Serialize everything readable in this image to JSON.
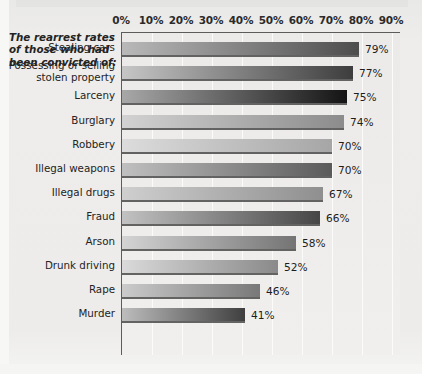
{
  "chart_data": {
    "type": "bar",
    "orientation": "horizontal",
    "title": "",
    "intro_label": "The rearrest rates of those who had been convicted of:",
    "xlabel": "",
    "ylabel": "",
    "xlim": [
      0,
      93
    ],
    "grid": true,
    "legend": "none",
    "tick_labels": [
      "0%",
      "10%",
      "20%",
      "30%",
      "40%",
      "50%",
      "60%",
      "70%",
      "80%",
      "90%"
    ],
    "tick_values": [
      0,
      10,
      20,
      30,
      40,
      50,
      60,
      70,
      80,
      90
    ],
    "categories": [
      "Stealing cars",
      "Possessing or selling\nstolen property",
      "Larceny",
      "Burglary",
      "Robbery",
      "Illegal weapons",
      "Illegal drugs",
      "Fraud",
      "Arson",
      "Drunk driving",
      "Rape",
      "Murder"
    ],
    "values": [
      79,
      77,
      75,
      74,
      70,
      70,
      67,
      66,
      58,
      52,
      46,
      41
    ],
    "value_labels": [
      "79%",
      "77%",
      "75%",
      "74%",
      "70%",
      "70%",
      "67%",
      "66%",
      "58%",
      "52%",
      "46%",
      "41%"
    ],
    "bar_styles": [
      {
        "from": "#b9b9b9",
        "to": "#4d4d4d"
      },
      {
        "from": "#c6c6c6",
        "to": "#3d3d3d"
      },
      {
        "from": "#a8a8a8",
        "to": "#141414"
      },
      {
        "from": "#d2d2d2",
        "to": "#8c8c8c"
      },
      {
        "from": "#dcdcdc",
        "to": "#a6a6a6"
      },
      {
        "from": "#c0c0c0",
        "to": "#5a5a5a"
      },
      {
        "from": "#cfcfcf",
        "to": "#8f8f8f"
      },
      {
        "from": "#c2c2c2",
        "to": "#464646"
      },
      {
        "from": "#d4d4d4",
        "to": "#747474"
      },
      {
        "from": "#dadada",
        "to": "#8a8a8a"
      },
      {
        "from": "#cbcbcb",
        "to": "#787878"
      },
      {
        "from": "#bdbdbd",
        "to": "#3f3f3f"
      }
    ],
    "colors": {
      "page_background": "#edecea",
      "plot_background": "#eeedeb",
      "gridline": "#fbfbfa",
      "axis": "#5c5c5c",
      "text": "#232323"
    }
  }
}
